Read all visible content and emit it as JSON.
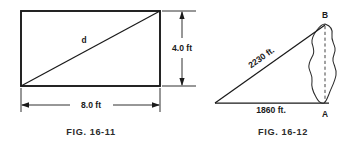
{
  "page": {
    "background_color": "#ffffff",
    "ink_color": "#1a1a1a",
    "width": 359,
    "height": 147
  },
  "figures": [
    {
      "id": "fig-16-11",
      "caption": "FIG. 16-11",
      "shape": "rectangle-with-diagonal",
      "labels": {
        "diagonal": "d",
        "width_dimension": "8.0 ft",
        "height_dimension": "4.0 ft"
      }
    },
    {
      "id": "fig-16-12",
      "caption": "FIG. 16-12",
      "shape": "right-triangle-with-lake",
      "labels": {
        "hypotenuse": "2230 ft.",
        "base": "1860 ft.",
        "vertex_top": "B",
        "vertex_bottom": "A"
      }
    }
  ]
}
